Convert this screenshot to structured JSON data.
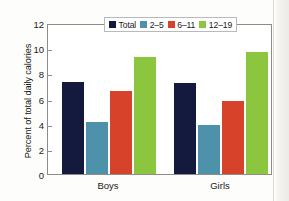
{
  "chart_data": {
    "type": "bar",
    "title": "",
    "xlabel": "",
    "ylabel": "Percent of total daily calories",
    "categories": [
      "Boys",
      "Girls"
    ],
    "ylim": [
      0,
      12
    ],
    "yticks": [
      0,
      2,
      4,
      6,
      8,
      10,
      12
    ],
    "ytick_labels": [
      "0",
      "2",
      "4",
      "6",
      "8",
      "10",
      "12"
    ],
    "grid": false,
    "legend_position": "top-center",
    "series": [
      {
        "name": "Total",
        "color": "#141a3d",
        "values": [
          7.3,
          7.2
        ]
      },
      {
        "name": "2–5",
        "color": "#4d91aa",
        "values": [
          4.1,
          3.9
        ]
      },
      {
        "name": "6–11",
        "color": "#d6432a",
        "values": [
          6.6,
          5.8
        ]
      },
      {
        "name": "12–19",
        "color": "#8cc63e",
        "values": [
          9.3,
          9.7
        ]
      }
    ]
  },
  "axis": {
    "y_title": "Percent of total daily calories",
    "tick_0": "0",
    "tick_2": "2",
    "tick_4": "4",
    "tick_6": "6",
    "tick_8": "8",
    "tick_10": "10",
    "tick_12": "12",
    "cat_boys": "Boys",
    "cat_girls": "Girls"
  },
  "legend": {
    "items": [
      {
        "label": "Total",
        "color": "#141a3d"
      },
      {
        "label": "2–5",
        "color": "#4d91aa"
      },
      {
        "label": "6–11",
        "color": "#d6432a"
      },
      {
        "label": "12–19",
        "color": "#8cc63e"
      }
    ]
  }
}
